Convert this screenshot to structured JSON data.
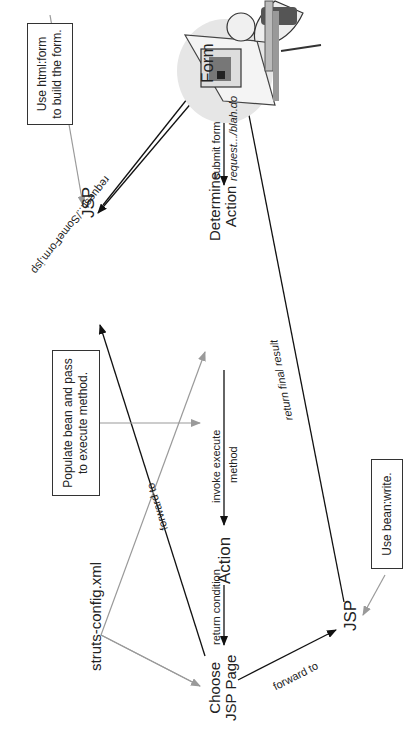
{
  "diagram": {
    "nodes": {
      "user": "User at computer",
      "form": "Form",
      "jsp_left": "JSP",
      "determine_action": [
        "Determine",
        "Action"
      ],
      "action": "Action",
      "choose_jsp": [
        "Choose",
        "JSP Page"
      ],
      "jsp_right": "JSP",
      "struts_config": "struts-config.xml"
    },
    "notes": {
      "html_form": [
        "Use html:form",
        "to build the form."
      ],
      "populate_bean": [
        "Populate bean and pass",
        "to execute method."
      ],
      "bean_write": "Use bean:write."
    },
    "edges": {
      "request_someform": "request.../SomeForm.jsp",
      "submit_form_top": "submit form",
      "submit_form_bottom": "request.../blah.do",
      "invoke_top": "invoke execute",
      "invoke_bottom": "method",
      "return_condition": "return condition",
      "forward_to_left": "forward to",
      "forward_to_right": "forward to",
      "return_final_result": "return final result"
    },
    "colors": {
      "line_dark": "#111111",
      "line_gray": "#9a9a9a",
      "text": "#222222"
    }
  }
}
